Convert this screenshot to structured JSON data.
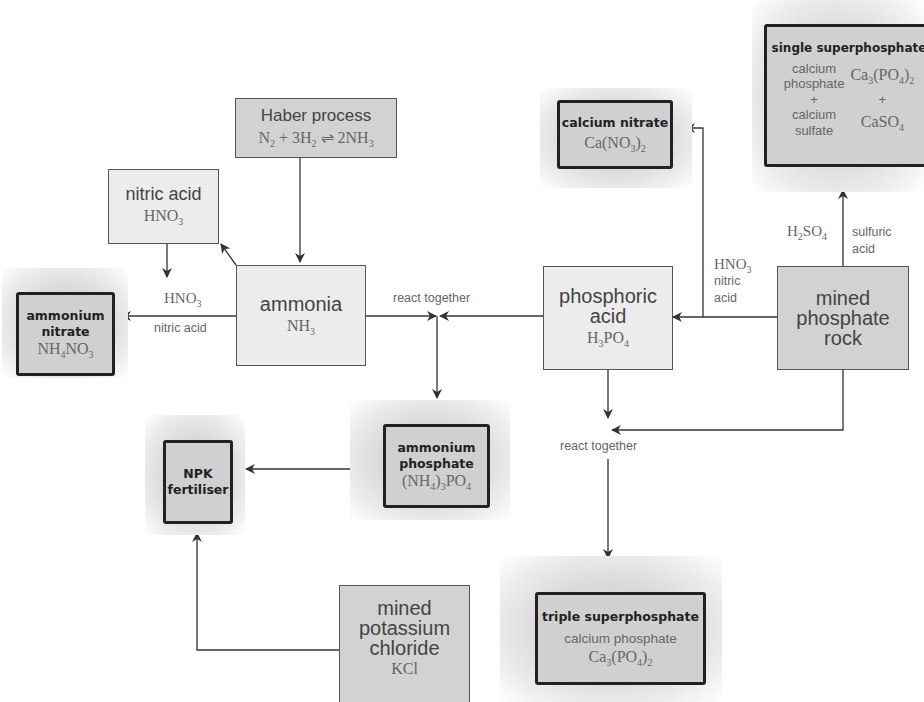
{
  "nodes": {
    "haber": {
      "title": "Haber process",
      "formula_html": "N<sub>2</sub> + 3H<sub>2</sub> &#8652; 2NH<sub>3</sub>"
    },
    "nitric_acid": {
      "title": "nitric acid",
      "formula_html": "HNO<sub>3</sub>"
    },
    "ammonia": {
      "title": "ammonia",
      "formula_html": "NH<sub>3</sub>"
    },
    "ammonium_nitrate": {
      "title_line1": "ammonium",
      "title_line2": "nitrate",
      "formula_html": "NH<sub>4</sub>NO<sub>3</sub>"
    },
    "calcium_nitrate": {
      "title": "calcium nitrate",
      "formula_html": "Ca(NO<sub>3</sub>)<sub>2</sub>"
    },
    "single_superphosphate": {
      "title": "single superphosphate",
      "component1_name_line1": "calcium",
      "component1_name_line2": "phosphate",
      "component1_formula_html": "Ca<sub>3</sub>(PO<sub>4</sub>)<sub>2</sub>",
      "plus": "+",
      "component2_name_line1": "calcium",
      "component2_name_line2": "sulfate",
      "component2_formula_html": "CaSO<sub>4</sub>"
    },
    "phosphoric_acid": {
      "title_line1": "phosphoric",
      "title_line2": "acid",
      "formula_html": "H<sub>3</sub>PO<sub>4</sub>"
    },
    "phosphate_rock": {
      "title_line1": "mined",
      "title_line2": "phosphate",
      "title_line3": "rock"
    },
    "ammonium_phosphate": {
      "title_line1": "ammonium",
      "title_line2": "phosphate",
      "formula_html": "(NH<sub>4</sub>)<sub>3</sub>PO<sub>4</sub>"
    },
    "npk": {
      "title_line1": "NPK",
      "title_line2": "fertiliser"
    },
    "potassium_chloride": {
      "title_line1": "mined",
      "title_line2": "potassium",
      "title_line3": "chloride",
      "formula_html": "KCl"
    },
    "triple_superphosphate": {
      "title": "triple superphosphate",
      "subtitle": "calcium phosphate",
      "formula_html": "Ca<sub>3</sub>(PO<sub>4</sub>)<sub>2</sub>"
    }
  },
  "edge_labels": {
    "hno3_to_ammonium_nitrate_formula_html": "HNO<sub>3</sub>",
    "hno3_to_ammonium_nitrate_name": "nitric acid",
    "react_together_top": "react together",
    "react_together_bottom": "react together",
    "hno3_to_calcium_nitrate_formula_html": "HNO<sub>3</sub>",
    "hno3_to_calcium_nitrate_name_line1": "nitric",
    "hno3_to_calcium_nitrate_name_line2": "acid",
    "h2so4_formula_html": "H<sub>2</sub>SO<sub>4</sub>",
    "h2so4_name_line1": "sulfuric",
    "h2so4_name_line2": "acid"
  },
  "colors": {
    "line": "#333333",
    "product_border": "#222222",
    "raw_box": "#d2d2d2",
    "intermediate_box": "#ececec"
  }
}
